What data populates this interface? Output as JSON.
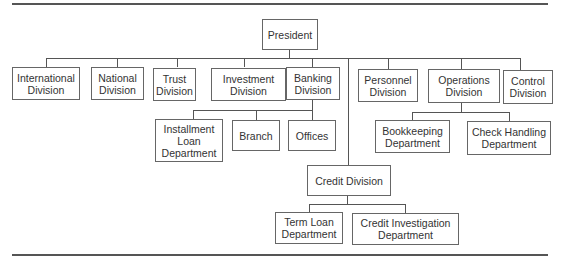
{
  "chart": {
    "type": "org-chart",
    "root": "President",
    "nodes": {
      "president": "President",
      "international": "International\nDivision",
      "national": "National\nDivision",
      "trust": "Trust\nDivision",
      "investment": "Investment\nDivision",
      "banking": "Banking\nDivision",
      "personnel": "Personnel\nDivision",
      "operations": "Operations\nDivision",
      "control": "Control\nDivision",
      "installment": "Installment\nLoan\nDepartment",
      "branch": "Branch",
      "offices": "Offices",
      "bookkeeping": "Bookkeeping\nDepartment",
      "check_handling": "Check Handling\nDepartment",
      "credit": "Credit Division",
      "term_loan": "Term Loan\nDepartment",
      "credit_investigation": "Credit Investigation\nDepartment"
    },
    "hierarchy": {
      "President": [
        "International Division",
        "National Division",
        "Trust Division",
        "Investment Division",
        "Banking Division",
        "Credit Division",
        "Personnel Division",
        "Operations Division",
        "Control Division"
      ],
      "Banking Division": [
        "Installment Loan Department",
        "Branch",
        "Offices"
      ],
      "Operations Division": [
        "Bookkeeping Department",
        "Check Handling Department"
      ],
      "Credit Division": [
        "Term Loan Department",
        "Credit Investigation Department"
      ]
    }
  }
}
